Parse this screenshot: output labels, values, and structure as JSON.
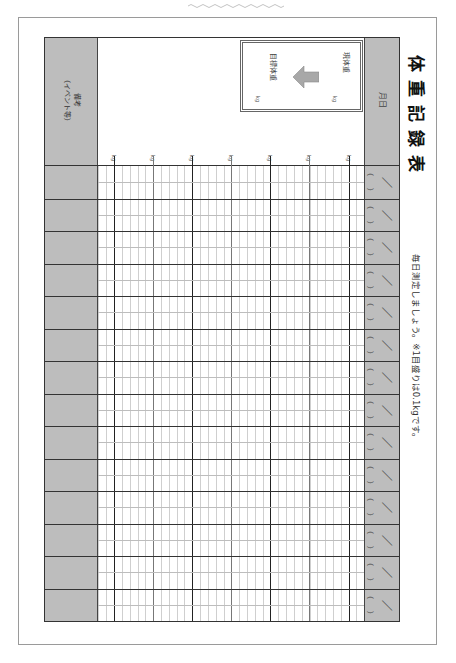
{
  "document": {
    "title": "体重記録表",
    "note": "毎日測定しましょう。※1目盛りは0.1kgです。",
    "headers": {
      "date": "月日",
      "remarks": "備考",
      "remarks_sub": "（イベント等）"
    },
    "goal_box": {
      "current_label": "現体重",
      "current_unit": "kg",
      "target_label": "目標体重",
      "target_unit": "kg"
    },
    "scale": {
      "unit_labels": [
        "kg",
        "kg",
        "kg",
        "kg",
        "kg",
        "kg",
        "kg"
      ],
      "minor_step_kg": 0.1
    },
    "rows": [
      {
        "date_paren_open": "（",
        "date_slash": "／",
        "date_paren_close": "）",
        "remarks": ""
      },
      {
        "date_paren_open": "（",
        "date_slash": "／",
        "date_paren_close": "）",
        "remarks": ""
      },
      {
        "date_paren_open": "（",
        "date_slash": "／",
        "date_paren_close": "）",
        "remarks": ""
      },
      {
        "date_paren_open": "（",
        "date_slash": "／",
        "date_paren_close": "）",
        "remarks": ""
      },
      {
        "date_paren_open": "（",
        "date_slash": "／",
        "date_paren_close": "）",
        "remarks": ""
      },
      {
        "date_paren_open": "（",
        "date_slash": "／",
        "date_paren_close": "）",
        "remarks": ""
      },
      {
        "date_paren_open": "（",
        "date_slash": "／",
        "date_paren_close": "）",
        "remarks": ""
      },
      {
        "date_paren_open": "（",
        "date_slash": "／",
        "date_paren_close": "）",
        "remarks": ""
      },
      {
        "date_paren_open": "（",
        "date_slash": "／",
        "date_paren_close": "）",
        "remarks": ""
      },
      {
        "date_paren_open": "（",
        "date_slash": "／",
        "date_paren_close": "）",
        "remarks": ""
      },
      {
        "date_paren_open": "（",
        "date_slash": "／",
        "date_paren_close": "）",
        "remarks": ""
      },
      {
        "date_paren_open": "（",
        "date_slash": "／",
        "date_paren_close": "）",
        "remarks": ""
      },
      {
        "date_paren_open": "（",
        "date_slash": "／",
        "date_paren_close": "）",
        "remarks": ""
      },
      {
        "date_paren_open": "（",
        "date_slash": "／",
        "date_paren_close": "）",
        "remarks": ""
      }
    ],
    "colors": {
      "header_gray": "#bdbdbd",
      "line_dark": "#333333",
      "line_minor": "#c8c8c8",
      "arrow_gray": "#a8a8a8"
    }
  }
}
